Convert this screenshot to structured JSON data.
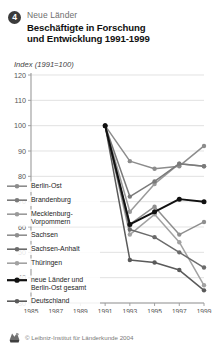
{
  "header": {
    "badge_number": "4",
    "kicker": "Neue Länder",
    "title_line1": "Beschäftigte in Forschung",
    "title_line2": "und Entwicklung 1991-1999"
  },
  "axis_caption": "Index (1991=100)",
  "footer": {
    "copyright": "© Leibniz-Institut für Länderkunde 2004",
    "logo_icon": "leibniz-logo-icon"
  },
  "colors": {
    "berlin_ost": "#8c8c8c",
    "brandenburg": "#7a7a7a",
    "mecklenburg": "#9a9a9a",
    "sachsen": "#8f8f8f",
    "sachsen_anhalt": "#6b6b6b",
    "thueringen": "#a2a2a2",
    "neue_laender": "#111111",
    "deutschland": "#5a5a5a",
    "grid": "#d6d6d6",
    "axis": "#9a9a9a",
    "badge": "#3b3b3b"
  },
  "chart_data": {
    "type": "line",
    "title": "Beschäftigte in Forschung und Entwicklung 1991-1999",
    "xlabel": "",
    "ylabel": "Index (1991=100)",
    "xlim": [
      1985,
      1999
    ],
    "ylim": [
      30,
      120
    ],
    "ygrid": true,
    "ytick_values": [
      30,
      40,
      50,
      60,
      70,
      80,
      90,
      100,
      110,
      120
    ],
    "ytick_labels": [
      "30",
      "40",
      "50",
      "60",
      "70",
      "80",
      "90",
      "100",
      "110",
      "120"
    ],
    "xtick_values": [
      1985,
      1987,
      1989,
      1991,
      1993,
      1995,
      1997,
      1999
    ],
    "xtick_labels": [
      "1985",
      "1987",
      "1989",
      "1991",
      "1993",
      "1995",
      "1997",
      "1999"
    ],
    "x": [
      1991,
      1993,
      1995,
      1997,
      1999
    ],
    "legend_position": "inside-left",
    "series": [
      {
        "name": "Berlin-Ost",
        "color_key": "berlin_ost",
        "values": [
          100,
          86,
          83,
          84,
          92
        ]
      },
      {
        "name": "Brandenburg",
        "color_key": "brandenburg",
        "values": [
          100,
          72,
          78,
          85,
          84
        ]
      },
      {
        "name": "Mecklenburg-Vorpommern",
        "color_key": "mecklenburg",
        "values": [
          100,
          66,
          77,
          85,
          84
        ]
      },
      {
        "name": "Sachsen",
        "color_key": "sachsen",
        "values": [
          100,
          61,
          68,
          57,
          62
        ]
      },
      {
        "name": "Sachsen-Anhalt",
        "color_key": "sachsen_anhalt",
        "values": [
          100,
          59,
          56,
          50,
          44
        ]
      },
      {
        "name": "Thüringen",
        "color_key": "thueringen",
        "values": [
          100,
          57,
          65,
          54,
          37
        ]
      },
      {
        "name": "neue Länder und Berlin-Ost gesamt",
        "color_key": "neue_laender",
        "values": [
          100,
          61,
          66,
          71,
          70
        ]
      },
      {
        "name": "Deutschland",
        "color_key": "deutschland",
        "values": [
          100,
          47,
          46,
          43,
          35
        ]
      }
    ]
  },
  "legend": {
    "items": [
      {
        "label": "Berlin-Ost",
        "label2": ""
      },
      {
        "label": "Brandenburg",
        "label2": ""
      },
      {
        "label": "Mecklenburg-",
        "label2": "Vorpommern"
      },
      {
        "label": "Sachsen",
        "label2": ""
      },
      {
        "label": "Sachsen-Anhalt",
        "label2": ""
      },
      {
        "label": "Thüringen",
        "label2": ""
      },
      {
        "label": "neue Länder und",
        "label2": "Berlin-Ost gesamt"
      },
      {
        "label": "Deutschland",
        "label2": ""
      }
    ]
  }
}
